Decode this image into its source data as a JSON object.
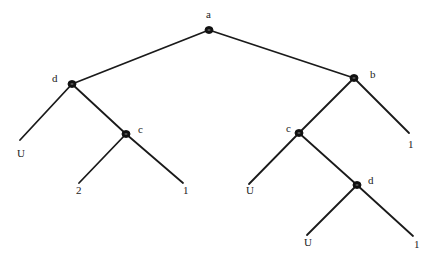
{
  "diagram": {
    "type": "game-tree",
    "nodes": [
      {
        "id": "root",
        "label": "a",
        "x": 209,
        "y": 30,
        "lx": 206,
        "ly": 18
      },
      {
        "id": "dL",
        "label": "d",
        "x": 72,
        "y": 84,
        "lx": 52,
        "ly": 82
      },
      {
        "id": "cL",
        "label": "c",
        "x": 126,
        "y": 134,
        "lx": 138,
        "ly": 133
      },
      {
        "id": "b",
        "label": "b",
        "x": 354,
        "y": 78,
        "lx": 370,
        "ly": 78
      },
      {
        "id": "cR",
        "label": "c",
        "x": 299,
        "y": 133,
        "lx": 286,
        "ly": 132
      },
      {
        "id": "dR",
        "label": "d",
        "x": 357,
        "y": 185,
        "lx": 368,
        "ly": 184
      }
    ],
    "leaves": [
      {
        "id": "leaf1",
        "label": "U",
        "x": 20,
        "y": 140,
        "lx": 17,
        "ly": 157
      },
      {
        "id": "leaf2",
        "label": "2",
        "x": 79,
        "y": 183,
        "lx": 76,
        "ly": 194
      },
      {
        "id": "leaf3",
        "label": "1",
        "x": 183,
        "y": 183,
        "lx": 183,
        "ly": 194
      },
      {
        "id": "leaf4",
        "label": "1",
        "x": 409,
        "y": 133,
        "lx": 408,
        "ly": 148
      },
      {
        "id": "leaf5",
        "label": "U",
        "x": 249,
        "y": 184,
        "lx": 246,
        "ly": 194
      },
      {
        "id": "leaf6",
        "label": "U",
        "x": 307,
        "y": 235,
        "lx": 304,
        "ly": 246
      },
      {
        "id": "leaf7",
        "label": "1",
        "x": 413,
        "y": 236,
        "lx": 414,
        "ly": 248
      }
    ],
    "edges": [
      [
        "root",
        "dL"
      ],
      [
        "root",
        "b"
      ],
      [
        "dL",
        "leaf1"
      ],
      [
        "dL",
        "cL"
      ],
      [
        "cL",
        "leaf2"
      ],
      [
        "cL",
        "leaf3"
      ],
      [
        "b",
        "cR"
      ],
      [
        "b",
        "leaf4"
      ],
      [
        "cR",
        "leaf5"
      ],
      [
        "cR",
        "dR"
      ],
      [
        "dR",
        "leaf6"
      ],
      [
        "dR",
        "leaf7"
      ]
    ]
  }
}
